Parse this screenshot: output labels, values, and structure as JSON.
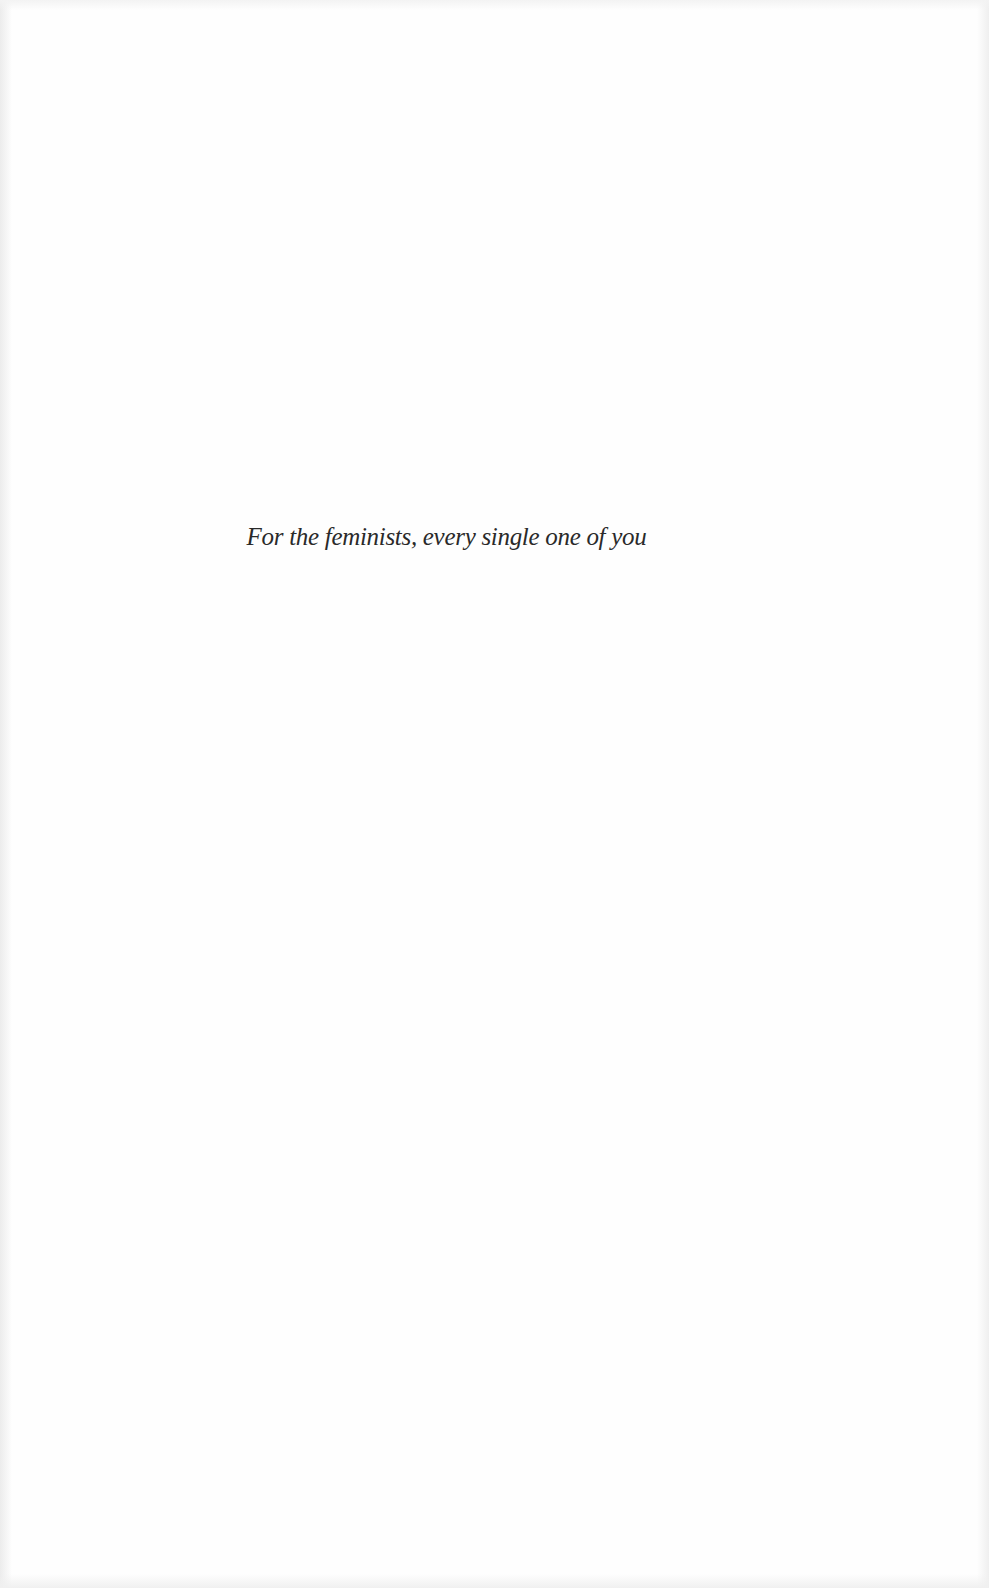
{
  "page": {
    "type": "dedication",
    "background_color": "#fefefe",
    "text_color": "#2a2a2a"
  },
  "dedication": {
    "text": "For the feminists, every single one of you"
  }
}
